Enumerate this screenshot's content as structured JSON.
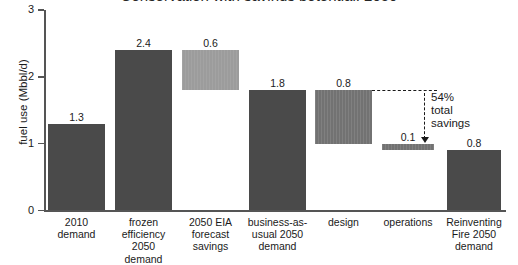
{
  "chart_data": {
    "type": "bar",
    "subtype": "waterfall",
    "title": "Conservation with savings potential, 2050",
    "xlabel": "",
    "ylabel": "fuel use (Mbbl/d)",
    "ylim": [
      0,
      3
    ],
    "yticks": [
      "0",
      "1",
      "2",
      "3"
    ],
    "grid": false,
    "legend": null,
    "categories": [
      "2010 demand",
      "frozen efficiency 2050 demand",
      "2050 EIA forecast savings",
      "business-as-usual 2050 demand",
      "design",
      "operations",
      "Reinventing Fire 2050 demand"
    ],
    "values": [
      1.3,
      2.4,
      0.6,
      1.8,
      0.8,
      0.1,
      0.8
    ],
    "bars": [
      {
        "label": "2010 demand",
        "label_lines": [
          "2010",
          "demand"
        ],
        "value": 1.3,
        "value_text": "1.3",
        "base": 0.0,
        "top": 1.3,
        "floating": false,
        "shade": "dark"
      },
      {
        "label": "frozen efficiency 2050 demand",
        "label_lines": [
          "frozen",
          "efficiency",
          "2050",
          "demand"
        ],
        "value": 2.4,
        "value_text": "2.4",
        "base": 0.0,
        "top": 2.4,
        "floating": false,
        "shade": "dark"
      },
      {
        "label": "2050 EIA forecast savings",
        "label_lines": [
          "2050 EIA",
          "forecast",
          "savings"
        ],
        "value": 0.6,
        "value_text": "0.6",
        "base": 1.8,
        "top": 2.4,
        "floating": true,
        "shade": "light"
      },
      {
        "label": "business-as-usual 2050 demand",
        "label_lines": [
          "business-as-",
          "usual 2050",
          "demand"
        ],
        "value": 1.8,
        "value_text": "1.8",
        "base": 0.0,
        "top": 1.8,
        "floating": false,
        "shade": "dark"
      },
      {
        "label": "design",
        "label_lines": [
          "design"
        ],
        "value": 0.8,
        "value_text": "0.8",
        "base": 1.0,
        "top": 1.8,
        "floating": true,
        "shade": "mid"
      },
      {
        "label": "operations",
        "label_lines": [
          "operations"
        ],
        "value": 0.1,
        "value_text": "0.1",
        "base": 0.9,
        "top": 1.0,
        "floating": true,
        "shade": "mid"
      },
      {
        "label": "Reinventing Fire 2050 demand",
        "label_lines": [
          "Reinventing",
          "Fire 2050",
          "demand"
        ],
        "value": 0.8,
        "value_text": "0.8",
        "base": 0.0,
        "top": 0.9,
        "floating": false,
        "shade": "dark"
      }
    ],
    "annotation": {
      "lines": [
        "54%",
        "total",
        "savings"
      ],
      "text": "54% total savings",
      "from_value": 1.8,
      "to_value": 0.9
    },
    "colors": {
      "dark_bar": "#4a4a4a",
      "mid_bar": "#727272",
      "light_bar": "#9c9c9c",
      "axis": "#555555",
      "text": "#1a1a1a",
      "background": "#ffffff"
    }
  }
}
